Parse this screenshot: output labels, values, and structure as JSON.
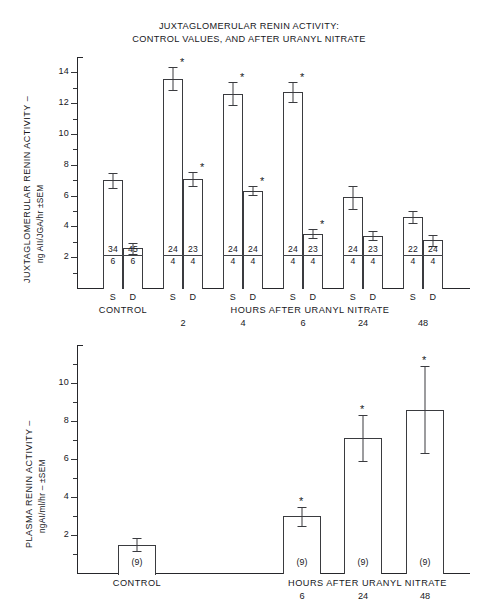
{
  "title": {
    "line1": "JUXTAGLOMERULAR RENIN ACTIVITY:",
    "line2": "CONTROL VALUES, AND AFTER URANYL NITRATE"
  },
  "chart_data": [
    {
      "type": "bar",
      "id": "jga-renin-activity",
      "title": "JUXTAGLOMERULAR RENIN ACTIVITY: CONTROL VALUES, AND AFTER URANYL NITRATE",
      "ylabel": "JUXTAGLOMERULAR RENIN ACTIVITY – ng AII/JGA/hr ±SEM",
      "ylabel_line1": "JUXTAGLOMERULAR RENIN ACTIVITY –",
      "ylabel_line2": "ng AII/JGA/hr ±SEM",
      "xlabel": "HOURS AFTER URANYL NITRATE",
      "ylim": [
        0,
        15
      ],
      "yticks": [
        2,
        4,
        6,
        8,
        10,
        12,
        14
      ],
      "ytick_labels": [
        "2",
        "4",
        "6",
        "8",
        "10",
        "12",
        "14"
      ],
      "minor_tick_step": 1,
      "grid": false,
      "legend": "none",
      "group_labels": [
        "CONTROL",
        "2",
        "4",
        "6",
        "24",
        "48"
      ],
      "xaxis_category_label": "CONTROL",
      "subgroup_labels": [
        "S",
        "D"
      ],
      "bars": [
        {
          "group": "CONTROL",
          "sub": "S",
          "value": 7.0,
          "sem": 0.5,
          "significant": false,
          "n_top": "34",
          "n_bottom": "6"
        },
        {
          "group": "CONTROL",
          "sub": "D",
          "value": 2.6,
          "sem": 0.35,
          "significant": false,
          "n_top": "45",
          "n_bottom": "6"
        },
        {
          "group": "2",
          "sub": "S",
          "value": 13.6,
          "sem": 0.75,
          "significant": true,
          "n_top": "24",
          "n_bottom": "4"
        },
        {
          "group": "2",
          "sub": "D",
          "value": 7.1,
          "sem": 0.45,
          "significant": true,
          "n_top": "23",
          "n_bottom": "4"
        },
        {
          "group": "4",
          "sub": "S",
          "value": 12.6,
          "sem": 0.75,
          "significant": true,
          "n_top": "24",
          "n_bottom": "4"
        },
        {
          "group": "4",
          "sub": "D",
          "value": 6.3,
          "sem": 0.3,
          "significant": true,
          "n_top": "24",
          "n_bottom": "4"
        },
        {
          "group": "6",
          "sub": "S",
          "value": 12.7,
          "sem": 0.65,
          "significant": true,
          "n_top": "24",
          "n_bottom": "4"
        },
        {
          "group": "6",
          "sub": "D",
          "value": 3.5,
          "sem": 0.3,
          "significant": true,
          "n_top": "23",
          "n_bottom": "4"
        },
        {
          "group": "24",
          "sub": "S",
          "value": 5.9,
          "sem": 0.75,
          "significant": false,
          "n_top": "24",
          "n_bottom": "4"
        },
        {
          "group": "24",
          "sub": "D",
          "value": 3.4,
          "sem": 0.3,
          "significant": false,
          "n_top": "23",
          "n_bottom": "4"
        },
        {
          "group": "48",
          "sub": "S",
          "value": 4.6,
          "sem": 0.4,
          "significant": false,
          "n_top": "22",
          "n_bottom": "4"
        },
        {
          "group": "48",
          "sub": "D",
          "value": 3.1,
          "sem": 0.35,
          "significant": false,
          "n_top": "24",
          "n_bottom": "4"
        }
      ]
    },
    {
      "type": "bar",
      "id": "plasma-renin-activity",
      "ylabel": "PLASMA RENIN ACTIVITY – ngAI/ml/hr – ±SEM",
      "ylabel_line1": "PLASMA RENIN ACTIVITY –",
      "ylabel_line2": "ngAI/ml/hr – ±SEM",
      "xlabel": "HOURS AFTER URANYL NITRATE",
      "ylim": [
        0,
        12
      ],
      "yticks": [
        2,
        4,
        6,
        8,
        10
      ],
      "ytick_labels": [
        "2",
        "4",
        "6",
        "8",
        "10"
      ],
      "minor_tick_step": 1,
      "grid": false,
      "legend": "none",
      "xaxis_category_label": "CONTROL",
      "group_labels": [
        "CONTROL",
        "6",
        "24",
        "48"
      ],
      "bars": [
        {
          "group": "CONTROL",
          "value": 1.5,
          "sem": 0.35,
          "significant": false,
          "n_label": "(9)"
        },
        {
          "group": "6",
          "value": 3.0,
          "sem": 0.5,
          "significant": true,
          "n_label": "(9)"
        },
        {
          "group": "24",
          "value": 7.1,
          "sem": 1.2,
          "significant": true,
          "n_label": "(9)"
        },
        {
          "group": "48",
          "value": 8.6,
          "sem": 2.3,
          "significant": true,
          "n_label": "(9)"
        }
      ]
    }
  ],
  "top_chart": {
    "ylabel_line1": "JUXTAGLOMERULAR RENIN ACTIVITY –",
    "ylabel_line2": "ng AII/JGA/hr ±SEM",
    "xlabel": "HOURS AFTER URANYL NITRATE",
    "control_label": "CONTROL",
    "yticks": [
      "14",
      "12",
      "10",
      "8",
      "6",
      "4",
      "2"
    ],
    "time_labels": [
      "2",
      "4",
      "6",
      "24",
      "48"
    ],
    "sub_s": "S",
    "sub_d": "D"
  },
  "bottom_chart": {
    "ylabel_line1": "PLASMA RENIN ACTIVITY –",
    "ylabel_line2": "ngAI/ml/hr – ±SEM",
    "xlabel": "HOURS AFTER URANYL NITRATE",
    "control_label": "CONTROL",
    "yticks": [
      "10",
      "8",
      "6",
      "4",
      "2"
    ],
    "time_labels": [
      "6",
      "24",
      "48"
    ],
    "n_label": "(9)"
  },
  "symbols": {
    "significance": "*"
  }
}
